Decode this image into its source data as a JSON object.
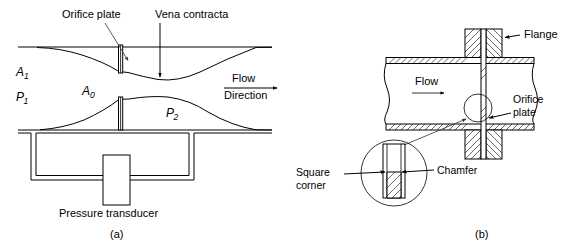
{
  "figure": {
    "captions": [
      {
        "id": "caption-a",
        "text": "(a)"
      },
      {
        "id": "caption-b",
        "text": "(b)"
      }
    ]
  },
  "panel_a": {
    "name": "orifice-flow-profile-panel",
    "labels": {
      "orifice_plate": "Orifice plate",
      "vena_contracta": "Vena contracta",
      "flow": "Flow",
      "direction": "Direction",
      "pressure_transducer": "Pressure transducer"
    },
    "symbols": {
      "area_upstream": "A",
      "area_upstream_sub": "1",
      "area_orifice": "A",
      "area_orifice_sub": "0",
      "pressure_upstream": "P",
      "pressure_upstream_sub": "1",
      "pressure_downstream": "P",
      "pressure_downstream_sub": "2"
    }
  },
  "panel_b": {
    "name": "orifice-plate-installation-panel",
    "labels": {
      "flange": "Flange",
      "flow": "Flow",
      "orifice_plate_line1": "Orifice",
      "orifice_plate_line2": "plate",
      "square_corner_line1": "Square",
      "square_corner_line2": "corner",
      "chamfer": "Chamfer"
    }
  },
  "colors": {
    "line": "#000000",
    "leader": "#4a4a4a",
    "background": "#ffffff"
  }
}
